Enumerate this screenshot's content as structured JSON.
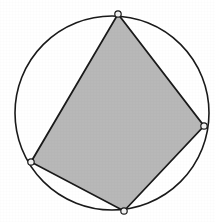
{
  "figure": {
    "background_color": "#ffffff",
    "canvas": {
      "width": 215,
      "height": 222
    }
  },
  "chart_data": {
    "type": "diagram",
    "xlabel": "",
    "ylabel": "",
    "grid": false,
    "legend": false,
    "xlim": [
      0,
      215
    ],
    "ylim": [
      0,
      222
    ],
    "shapes": [
      {
        "name": "circumscribed-circle",
        "type": "circle",
        "cx": 112,
        "cy": 113,
        "r": 97,
        "fill": "#ffffff",
        "stroke": "#1a1a1a",
        "stroke_width": 1.6
      },
      {
        "name": "inscribed-quadrilateral",
        "type": "polygon",
        "points": [
          [
            118,
            14
          ],
          [
            204,
            126
          ],
          [
            124,
            211
          ],
          [
            31,
            162
          ]
        ],
        "fill": "#b8b8b8",
        "stroke": "#1a1a1a",
        "stroke_width": 1.8
      }
    ],
    "vertices": [
      {
        "name": "vertex-top",
        "label": "",
        "x": 118,
        "y": 14,
        "marker": "open-circle",
        "r": 3.2
      },
      {
        "name": "vertex-right",
        "label": "",
        "x": 204,
        "y": 126,
        "marker": "open-circle",
        "r": 3.2
      },
      {
        "name": "vertex-bottom",
        "label": "",
        "x": 124,
        "y": 211,
        "marker": "open-circle",
        "r": 3.2
      },
      {
        "name": "vertex-left",
        "label": "",
        "x": 31,
        "y": 162,
        "marker": "open-circle",
        "r": 3.2
      }
    ],
    "colors": {
      "stroke": "#1a1a1a",
      "quad_fill": "#b8b8b8",
      "circle_fill": "#ffffff",
      "vertex_fill": "#f2f2f2",
      "background": "#ffffff"
    }
  }
}
